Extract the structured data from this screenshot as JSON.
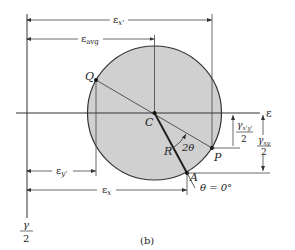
{
  "figure": {
    "caption": "(b)",
    "axes": {
      "horizontal_label": "ε",
      "vertical_label_num": "γ",
      "vertical_label_den": "2"
    },
    "circle": {
      "fill": "#d0d0d0",
      "stroke": "#333333"
    },
    "points": {
      "center": "C",
      "q": "Q",
      "p": "P",
      "a": "A"
    },
    "radius_label": "R",
    "angle_label": "2θ",
    "theta_zero_label": "θ = 0°",
    "dimensions": {
      "eps_x_prime": "ε",
      "eps_x_prime_sub": "x'",
      "eps_avg": "ε",
      "eps_avg_sub": "avg",
      "eps_y_prime": "ε",
      "eps_y_prime_sub": "y'",
      "eps_x": "ε",
      "eps_x_sub": "x",
      "gamma_xy_prime_num": "γ",
      "gamma_xy_prime_num_sub": "x'y'",
      "gamma_xy_prime_den": "2",
      "gamma_xy_num": "γ",
      "gamma_xy_num_sub": "xy",
      "gamma_xy_den": "2"
    }
  }
}
